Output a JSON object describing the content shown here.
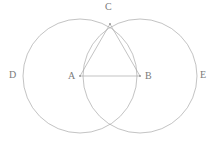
{
  "figure": {
    "kind": "geometry-diagram",
    "caption": "Two overlapping congruent circles with inscribed triangle",
    "background_color": "#ffffff",
    "stroke_color": "#a9a9a9",
    "label_color": "#7a7a7a",
    "stroke_width": 0.7,
    "canvas": {
      "width": 220,
      "height": 149
    }
  },
  "points": {
    "A": {
      "label": "A",
      "x": 80,
      "y": 76,
      "label_x": 68,
      "label_y": 71,
      "role": "center-of-left-circle"
    },
    "B": {
      "label": "B",
      "x": 140,
      "y": 76,
      "label_x": 145,
      "label_y": 71,
      "role": "center-of-right-circle"
    },
    "C": {
      "label": "C",
      "x": 110,
      "y": 24,
      "label_x": 105,
      "label_y": 2,
      "role": "upper-intersection"
    },
    "D": {
      "label": "D",
      "x": 23,
      "y": 76,
      "label_x": 9,
      "label_y": 70,
      "role": "left-extreme-of-left-circle"
    },
    "E": {
      "label": "E",
      "x": 197,
      "y": 76,
      "label_x": 200,
      "label_y": 70,
      "role": "right-extreme-of-right-circle"
    },
    "F": {
      "label": "",
      "x": 110,
      "y": 128,
      "label_x": 0,
      "label_y": 0,
      "role": "lower-intersection"
    }
  },
  "circles": [
    {
      "name": "left-circle",
      "cx": 80,
      "cy": 76,
      "r": 57
    },
    {
      "name": "right-circle",
      "cx": 140,
      "cy": 76,
      "r": 57
    }
  ],
  "segments": [
    {
      "name": "segment-ab",
      "x1": 80,
      "y1": 76,
      "x2": 140,
      "y2": 76,
      "from": "A",
      "to": "B"
    },
    {
      "name": "segment-ac",
      "x1": 80,
      "y1": 76,
      "x2": 110,
      "y2": 24,
      "from": "A",
      "to": "C"
    },
    {
      "name": "segment-cb",
      "x1": 110,
      "y1": 24,
      "x2": 140,
      "y2": 76,
      "from": "C",
      "to": "B"
    }
  ],
  "labels": {
    "A": "A",
    "B": "B",
    "C": "C",
    "D": "D",
    "E": "E"
  }
}
